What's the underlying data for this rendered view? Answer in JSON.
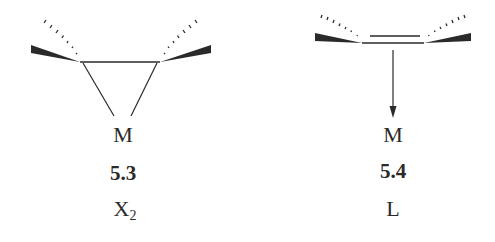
{
  "structures": [
    {
      "id": "metallacyclopropane",
      "metal_label": "M",
      "compound_number": "5.3",
      "ligand_type_main": "X",
      "ligand_type_subscript": "2",
      "bonding": "two sigma M–C bonds (triangle)"
    },
    {
      "id": "pi-alkene-complex",
      "metal_label": "M",
      "compound_number": "5.4",
      "ligand_type_main": "L",
      "ligand_type_subscript": "",
      "bonding": "C=C double bond donating to M (arrow)"
    }
  ],
  "colors": {
    "ink": "#2a2a2a",
    "background": "#ffffff"
  }
}
